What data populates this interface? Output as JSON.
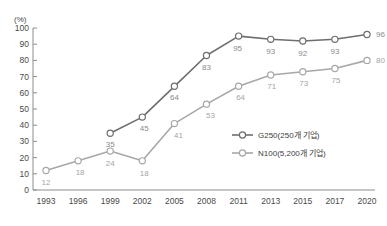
{
  "chart_data": {
    "type": "line",
    "title": "",
    "xlabel": "",
    "ylabel": "(%)",
    "unit_label": "(%)",
    "categories": [
      "1993",
      "1996",
      "1999",
      "2002",
      "2005",
      "2008",
      "2011",
      "2013",
      "2015",
      "2017",
      "2020"
    ],
    "ylim": [
      0,
      100
    ],
    "ytick_step": 10,
    "yticks": [
      "0",
      "10",
      "20",
      "30",
      "40",
      "50",
      "60",
      "70",
      "80",
      "90",
      "100"
    ],
    "grid": false,
    "legend_position": "inside-right-lower",
    "series": [
      {
        "name": "G250(250개 기업)",
        "color": "#6e6e6e",
        "marker": "open-circle",
        "x": [
          "1999",
          "2002",
          "2005",
          "2008",
          "2011",
          "2013",
          "2015",
          "2017",
          "2020"
        ],
        "values": [
          35,
          45,
          64,
          83,
          95,
          93,
          92,
          93,
          96
        ],
        "labels": [
          "35",
          "45",
          "64",
          "83",
          "95",
          "93",
          "92",
          "93",
          "96"
        ]
      },
      {
        "name": "N100(5,200개 기업)",
        "color": "#a8a8a8",
        "marker": "open-circle",
        "x": [
          "1993",
          "1996",
          "1999",
          "2002",
          "2005",
          "2008",
          "2011",
          "2013",
          "2015",
          "2017",
          "2020"
        ],
        "values": [
          12,
          18,
          24,
          18,
          41,
          53,
          64,
          71,
          73,
          75,
          80
        ],
        "labels": [
          "12",
          "18",
          "24",
          "18",
          "41",
          "53",
          "64",
          "71",
          "73",
          "75",
          "80"
        ]
      }
    ]
  },
  "legend": {
    "items": [
      {
        "label": "G250(250개 기업)"
      },
      {
        "label": "N100(5,200개 기업)"
      }
    ]
  },
  "axis": {
    "y_unit": "(%)",
    "y_ticks": [
      "100",
      "90",
      "80",
      "70",
      "60",
      "50",
      "40",
      "30",
      "20",
      "10",
      "0"
    ],
    "x_ticks": [
      "1993",
      "1996",
      "1999",
      "2002",
      "2005",
      "2008",
      "2011",
      "2013",
      "2015",
      "2017",
      "2020"
    ]
  }
}
